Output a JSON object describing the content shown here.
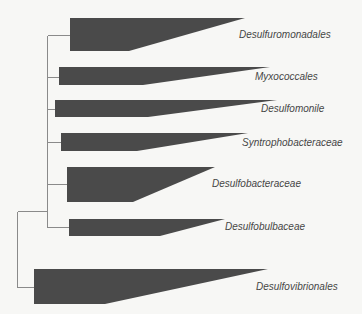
{
  "diagram": {
    "type": "phylogenetic-tree",
    "style": {
      "background": "#f7f7f5",
      "wedge_fill": "#4a4a4a",
      "line_color": "#8a8a8a",
      "label_color": "#464646"
    },
    "clades": [
      {
        "id": "desulfuromonadales",
        "label": "Desulfuromonadales"
      },
      {
        "id": "myxococcales",
        "label": "Myxococcales"
      },
      {
        "id": "desulfomonile",
        "label": "Desulfomonile"
      },
      {
        "id": "syntrophobacteraceae",
        "label": "Syntrophobacteraceae"
      },
      {
        "id": "desulfobacteraceae",
        "label": "Desulfobacteraceae"
      },
      {
        "id": "desulfobulbaceae",
        "label": "Desulfobulbaceae"
      },
      {
        "id": "desulfovibrionales",
        "label": "Desulfovibrionales"
      }
    ]
  }
}
